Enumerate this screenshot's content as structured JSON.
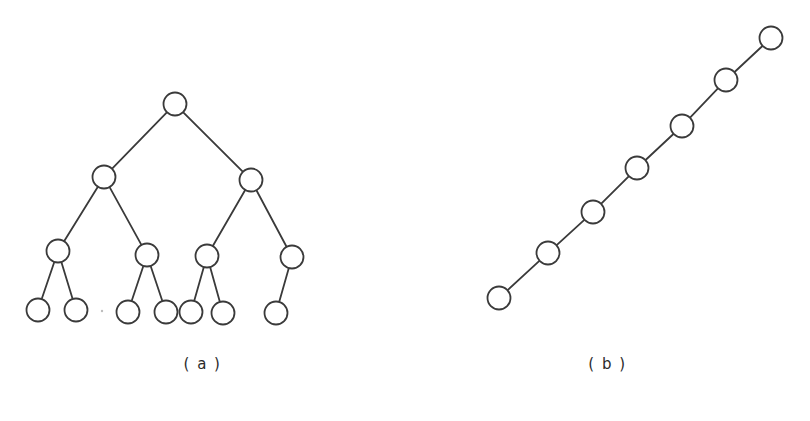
{
  "figure": {
    "background_color": "#ffffff",
    "stroke_color": "#3a3a3a",
    "node_fill_color": "#ffffff",
    "caption_color": "#2b2b2b",
    "width": 810,
    "height": 421
  },
  "panels": [
    {
      "id": "a",
      "caption": "( a )",
      "graph_type": "tree",
      "description": "rooted binary tree of depth 3",
      "node_radius": 11.5,
      "edge_width": 1.8,
      "nodes": [
        {
          "id": "n0",
          "label": "",
          "level": 0,
          "x": 175,
          "y": 104,
          "r": 11.5
        },
        {
          "id": "n1",
          "label": "",
          "level": 1,
          "x": 104,
          "y": 177,
          "r": 11.5
        },
        {
          "id": "n2",
          "label": "",
          "level": 1,
          "x": 251,
          "y": 180,
          "r": 11.5
        },
        {
          "id": "n3",
          "label": "",
          "level": 2,
          "x": 58,
          "y": 251,
          "r": 11.5
        },
        {
          "id": "n4",
          "label": "",
          "level": 2,
          "x": 147,
          "y": 255,
          "r": 11.5
        },
        {
          "id": "n5",
          "label": "",
          "level": 2,
          "x": 207,
          "y": 256,
          "r": 11.5
        },
        {
          "id": "n6",
          "label": "",
          "level": 2,
          "x": 292,
          "y": 257,
          "r": 11.5
        },
        {
          "id": "n7",
          "label": "",
          "level": 3,
          "x": 38,
          "y": 310,
          "r": 11.5
        },
        {
          "id": "n8",
          "label": "",
          "level": 3,
          "x": 76,
          "y": 310,
          "r": 11.5
        },
        {
          "id": "n9",
          "label": "",
          "level": 3,
          "x": 128,
          "y": 312,
          "r": 11.5
        },
        {
          "id": "n10",
          "label": "",
          "level": 3,
          "x": 166,
          "y": 312,
          "r": 11.5
        },
        {
          "id": "n11",
          "label": "",
          "level": 3,
          "x": 191,
          "y": 312,
          "r": 11.5
        },
        {
          "id": "n12",
          "label": "",
          "level": 3,
          "x": 223,
          "y": 313,
          "r": 11.5
        },
        {
          "id": "n13",
          "label": "",
          "level": 3,
          "x": 276,
          "y": 313,
          "r": 11.5
        }
      ],
      "edges": [
        {
          "from": "n0",
          "to": "n1"
        },
        {
          "from": "n0",
          "to": "n2"
        },
        {
          "from": "n1",
          "to": "n3"
        },
        {
          "from": "n1",
          "to": "n4"
        },
        {
          "from": "n2",
          "to": "n5"
        },
        {
          "from": "n2",
          "to": "n6"
        },
        {
          "from": "n3",
          "to": "n7"
        },
        {
          "from": "n3",
          "to": "n8"
        },
        {
          "from": "n4",
          "to": "n9"
        },
        {
          "from": "n4",
          "to": "n10"
        },
        {
          "from": "n5",
          "to": "n11"
        },
        {
          "from": "n5",
          "to": "n12"
        },
        {
          "from": "n6",
          "to": "n13"
        }
      ],
      "marks": [
        {
          "id": "speck",
          "x": 102,
          "y": 311,
          "r": 1.2
        }
      ]
    },
    {
      "id": "b",
      "caption": "( b )",
      "graph_type": "path",
      "description": "linear chain of 8 nodes ascending left to right",
      "node_radius": 11.5,
      "edge_width": 1.8,
      "nodes": [
        {
          "id": "p0",
          "label": "",
          "index": 0,
          "x": 499,
          "y": 298,
          "r": 11.5
        },
        {
          "id": "p1",
          "label": "",
          "index": 1,
          "x": 548,
          "y": 253,
          "r": 11.5
        },
        {
          "id": "p2",
          "label": "",
          "index": 2,
          "x": 593,
          "y": 212,
          "r": 11.5
        },
        {
          "id": "p3",
          "label": "",
          "index": 3,
          "x": 637,
          "y": 168,
          "r": 11.5
        },
        {
          "id": "p4",
          "label": "",
          "index": 4,
          "x": 682,
          "y": 126,
          "r": 11.5
        },
        {
          "id": "p5",
          "label": "",
          "index": 5,
          "x": 726,
          "y": 80,
          "r": 11.5
        },
        {
          "id": "p6",
          "label": "",
          "index": 6,
          "x": 771,
          "y": 38,
          "r": 11.5
        }
      ],
      "edges": [
        {
          "from": "p0",
          "to": "p1"
        },
        {
          "from": "p1",
          "to": "p2"
        },
        {
          "from": "p2",
          "to": "p3"
        },
        {
          "from": "p3",
          "to": "p4"
        },
        {
          "from": "p4",
          "to": "p5"
        },
        {
          "from": "p5",
          "to": "p6"
        }
      ],
      "marks": []
    }
  ]
}
